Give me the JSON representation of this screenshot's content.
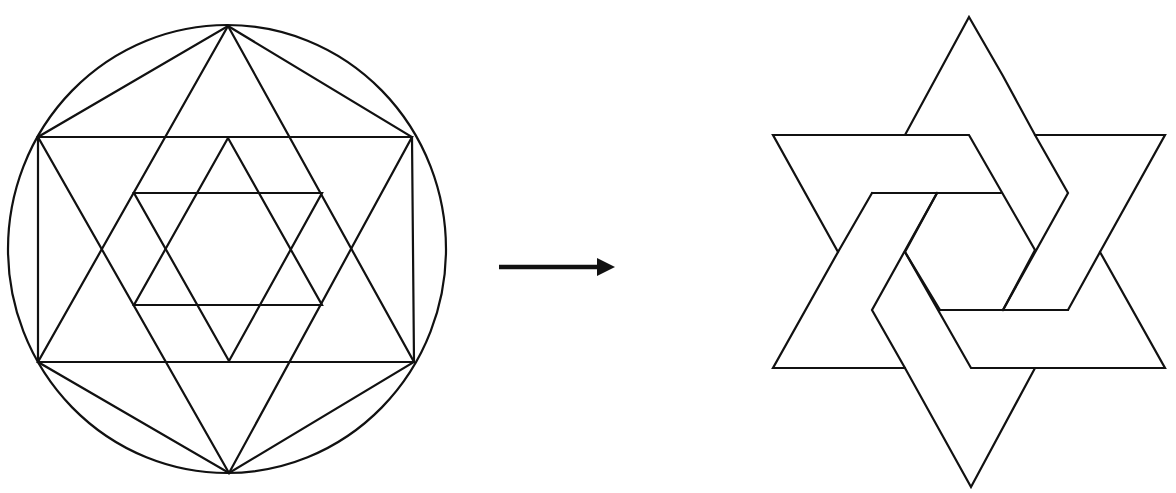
{
  "diagram": {
    "colors": {
      "line": "#111111",
      "background": "#ffffff"
    },
    "left_figure": {
      "name": "construction",
      "circle": {
        "cx": 227,
        "cy": 249,
        "r": 222
      },
      "outer_hexagon_vertices": [
        [
          228,
          26
        ],
        [
          412,
          137
        ],
        [
          414,
          362
        ],
        [
          229,
          473
        ],
        [
          38,
          362
        ],
        [
          38,
          137
        ]
      ],
      "outer_hexagram": {
        "up_triangle": [
          [
            228,
            26
          ],
          [
            414,
            362
          ],
          [
            38,
            362
          ]
        ],
        "down_triangle": [
          [
            229,
            473
          ],
          [
            412,
            137
          ],
          [
            38,
            137
          ]
        ]
      },
      "rectangle": [
        [
          38,
          137
        ],
        [
          412,
          137
        ],
        [
          414,
          362
        ],
        [
          38,
          362
        ]
      ],
      "inner_hexagram": {
        "up_triangle": [
          [
            228,
            138
          ],
          [
            322,
            305
          ],
          [
            134,
            305
          ]
        ],
        "down_triangle": [
          [
            229,
            361
          ],
          [
            322,
            193
          ],
          [
            134,
            193
          ]
        ]
      }
    },
    "arrow": {
      "from": [
        499,
        267
      ],
      "to": [
        615,
        267
      ],
      "direction": "right"
    },
    "right_figure": {
      "name": "interlaced-hexagram",
      "outer_points": {
        "top": [
          969,
          17
        ],
        "top_right": [
          1165,
          135
        ],
        "bottom_right": [
          1165,
          368
        ],
        "bottom": [
          971,
          487
        ],
        "bottom_left": [
          773,
          368
        ],
        "top_left": [
          773,
          135
        ]
      }
    }
  }
}
